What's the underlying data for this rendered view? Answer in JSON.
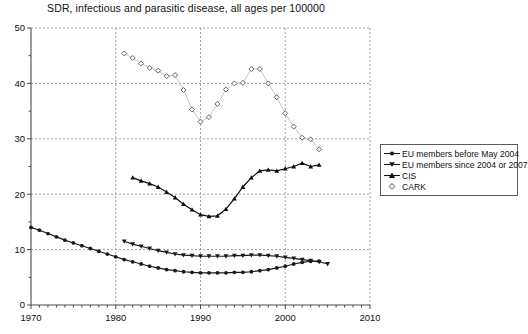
{
  "chart_data": {
    "type": "line",
    "title": "SDR, infectious and parasitic disease, all ages per 100000",
    "xlabel": "",
    "ylabel": "",
    "xlim": [
      1970,
      2010
    ],
    "ylim": [
      0,
      50
    ],
    "xticks": [
      1970,
      1980,
      1990,
      2000,
      2010
    ],
    "yticks": [
      0,
      10,
      20,
      30,
      40,
      50
    ],
    "xminor_step": 1,
    "yminor_step": 5,
    "grid": true,
    "grid_style": "dashed",
    "legend_position": "right",
    "series": [
      {
        "name": "EU members before May 2004",
        "marker": "circle-filled",
        "color": "#1a1a1a",
        "x": [
          1970,
          1971,
          1972,
          1973,
          1974,
          1975,
          1976,
          1977,
          1978,
          1979,
          1980,
          1981,
          1982,
          1983,
          1984,
          1985,
          1986,
          1987,
          1988,
          1989,
          1990,
          1991,
          1992,
          1993,
          1994,
          1995,
          1996,
          1997,
          1998,
          1999,
          2000,
          2001,
          2002,
          2003,
          2004
        ],
        "values": [
          14.0,
          13.5,
          12.9,
          12.3,
          11.7,
          11.2,
          10.7,
          10.2,
          9.7,
          9.2,
          8.7,
          8.2,
          7.8,
          7.4,
          7.0,
          6.7,
          6.4,
          6.2,
          6.0,
          5.9,
          5.8,
          5.8,
          5.8,
          5.8,
          5.9,
          5.9,
          6.0,
          6.2,
          6.4,
          6.7,
          7.0,
          7.4,
          7.7,
          7.9,
          7.9
        ]
      },
      {
        "name": "EU members since 2004 or 2007",
        "marker": "triangle-down-filled",
        "color": "#1a1a1a",
        "x": [
          1981,
          1982,
          1983,
          1984,
          1985,
          1986,
          1987,
          1988,
          1989,
          1990,
          1991,
          1992,
          1993,
          1994,
          1995,
          1996,
          1997,
          1998,
          1999,
          2000,
          2001,
          2002,
          2003,
          2004,
          2005
        ],
        "values": [
          11.5,
          11.0,
          10.6,
          10.2,
          9.8,
          9.5,
          9.2,
          9.0,
          8.9,
          8.8,
          8.8,
          8.8,
          8.8,
          8.9,
          8.9,
          9.0,
          9.0,
          8.9,
          8.8,
          8.6,
          8.4,
          8.2,
          8.0,
          7.8,
          7.4
        ]
      },
      {
        "name": "CIS",
        "marker": "triangle-up-filled",
        "color": "#0d0d0d",
        "x": [
          1982,
          1983,
          1984,
          1985,
          1986,
          1987,
          1988,
          1989,
          1990,
          1991,
          1992,
          1993,
          1994,
          1995,
          1996,
          1997,
          1998,
          1999,
          2000,
          2001,
          2002,
          2003,
          2004
        ],
        "values": [
          23.0,
          22.4,
          21.9,
          21.3,
          20.4,
          19.4,
          18.2,
          17.2,
          16.3,
          16.0,
          16.1,
          17.3,
          19.2,
          21.3,
          23.0,
          24.2,
          24.4,
          24.2,
          24.6,
          25.0,
          25.6,
          25.0,
          25.3
        ]
      },
      {
        "name": "CARK",
        "marker": "diamond-open",
        "color": "#555555",
        "x": [
          1981,
          1982,
          1983,
          1984,
          1985,
          1986,
          1987,
          1988,
          1989,
          1990,
          1991,
          1992,
          1993,
          1994,
          1995,
          1996,
          1997,
          1998,
          1999,
          2000,
          2001,
          2002,
          2003,
          2004
        ],
        "values": [
          45.4,
          44.6,
          43.6,
          42.8,
          42.3,
          41.3,
          41.5,
          38.8,
          35.3,
          33.1,
          33.9,
          36.3,
          38.9,
          40.0,
          40.1,
          42.6,
          42.6,
          40.0,
          37.5,
          34.6,
          32.2,
          30.2,
          29.9,
          28.1
        ]
      }
    ]
  },
  "legend": {
    "items": [
      {
        "label": "EU members before May 2004"
      },
      {
        "label": "EU members since 2004 or 2007"
      },
      {
        "label": "CIS"
      },
      {
        "label": "CARK"
      }
    ]
  }
}
